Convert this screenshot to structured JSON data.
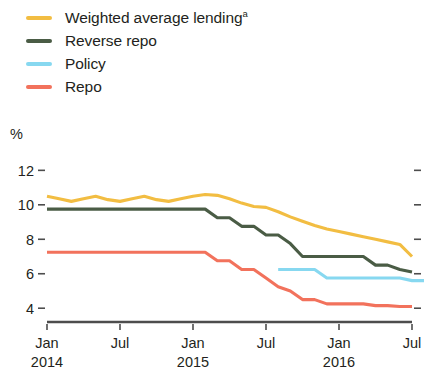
{
  "chart_data": {
    "type": "line",
    "title": "",
    "xlabel": "",
    "ylabel": "%",
    "ylim": [
      3.2,
      12.6
    ],
    "yticks": [
      4,
      6,
      8,
      10,
      12
    ],
    "ytick_labels": [
      "4",
      "6",
      "8",
      "10",
      "12"
    ],
    "grid": false,
    "legend_position": "top-left",
    "x_axis_type": "monthly",
    "x_start": "2014-01",
    "x_end": "2016-07",
    "x_tick_positions": [
      0,
      6,
      12,
      18,
      24,
      30
    ],
    "x_tick_labels": [
      "Jan",
      "Jul",
      "Jan",
      "Jul",
      "Jan",
      "Jul"
    ],
    "x_tick_sublabels": [
      "2014",
      "",
      "2015",
      "",
      "2016",
      ""
    ],
    "x_labels_full": [
      {
        "label": "Jan",
        "sublabel": "2014"
      },
      {
        "label": "Jul",
        "sublabel": ""
      },
      {
        "label": "Jan",
        "sublabel": "2015"
      },
      {
        "label": "Jul",
        "sublabel": ""
      },
      {
        "label": "Jan",
        "sublabel": "2016"
      },
      {
        "label": "Jul",
        "sublabel": ""
      }
    ],
    "series": [
      {
        "name": "Weighted average lending",
        "name_superscript": "a",
        "color": "#f2bd42",
        "x_offset": 0,
        "values": [
          10.5,
          10.35,
          10.2,
          10.35,
          10.5,
          10.3,
          10.2,
          10.35,
          10.5,
          10.3,
          10.2,
          10.35,
          10.5,
          10.6,
          10.55,
          10.35,
          10.1,
          9.9,
          9.85,
          9.6,
          9.3,
          9.05,
          8.8,
          8.6,
          8.45,
          8.3,
          8.15,
          8.0,
          7.85,
          7.7,
          7.0
        ]
      },
      {
        "name": "Reverse repo",
        "color": "#4a5c45",
        "x_offset": 0,
        "values": [
          9.75,
          9.75,
          9.75,
          9.75,
          9.75,
          9.75,
          9.75,
          9.75,
          9.75,
          9.75,
          9.75,
          9.75,
          9.75,
          9.75,
          9.25,
          9.25,
          8.75,
          8.75,
          8.25,
          8.25,
          7.75,
          7.0,
          7.0,
          7.0,
          7.0,
          7.0,
          7.0,
          6.5,
          6.5,
          6.25,
          6.1
        ]
      },
      {
        "name": "Policy",
        "color": "#87d8f0",
        "x_offset": 19,
        "values": [
          6.25,
          6.25,
          6.25,
          6.25,
          5.75,
          5.75,
          5.75,
          5.75,
          5.75,
          5.75,
          5.75,
          5.6,
          5.6
        ]
      },
      {
        "name": "Repo",
        "color": "#f2725c",
        "x_offset": 0,
        "values": [
          7.25,
          7.25,
          7.25,
          7.25,
          7.25,
          7.25,
          7.25,
          7.25,
          7.25,
          7.25,
          7.25,
          7.25,
          7.25,
          7.25,
          6.75,
          6.75,
          6.25,
          6.25,
          5.75,
          5.25,
          5.0,
          4.5,
          4.5,
          4.25,
          4.25,
          4.25,
          4.25,
          4.15,
          4.15,
          4.1,
          4.1
        ]
      }
    ],
    "legend_entries": [
      {
        "label": "Weighted average lending",
        "superscript": "a",
        "color": "#f2bd42"
      },
      {
        "label": "Reverse repo",
        "superscript": "",
        "color": "#4a5c45"
      },
      {
        "label": "Policy",
        "superscript": "",
        "color": "#87d8f0"
      },
      {
        "label": "Repo",
        "superscript": "",
        "color": "#f2725c"
      }
    ]
  },
  "axis": {
    "unit_label": "%"
  },
  "colors": {
    "axis": "#4d4d4d",
    "text": "#231f20",
    "background": "#ffffff"
  }
}
